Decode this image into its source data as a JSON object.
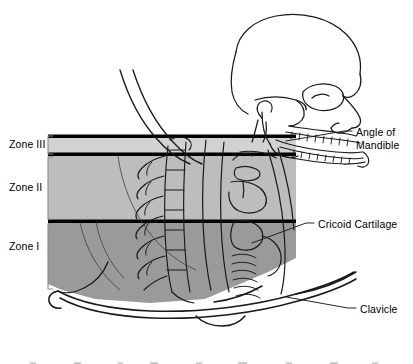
{
  "figure": {
    "type": "anatomical-illustration",
    "view": "lateral / sagittal, facing right"
  },
  "zones": [
    {
      "id": "zone-3",
      "label": "Zone III",
      "fill": "#d2d2d2",
      "top": 138,
      "bottom": 155
    },
    {
      "id": "zone-2",
      "label": "Zone II",
      "fill": "#bdbdbd",
      "top": 156,
      "bottom": 221
    },
    {
      "id": "zone-1",
      "label": "Zone I",
      "fill": "#9a9a9a",
      "top": 223,
      "bottom": 300
    }
  ],
  "callouts": [
    {
      "id": "angle-of-mandible",
      "line1": "Angle of",
      "line2": "Mandible"
    },
    {
      "id": "cricoid-cartilage",
      "text": "Cricoid Cartilage"
    },
    {
      "id": "clavicle",
      "text": "Clavicle"
    }
  ],
  "colors": {
    "ink": "#000000",
    "zone3": "#d2d2d2",
    "zone2": "#bdbdbd",
    "zone1": "#9a9a9a",
    "bracket": "#8a8a8a",
    "background": "#ffffff"
  }
}
